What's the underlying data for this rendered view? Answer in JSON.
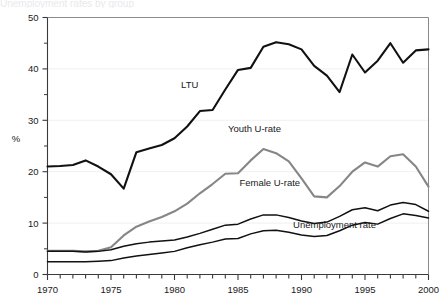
{
  "chart_data": {
    "type": "line",
    "title": "",
    "xlabel": "",
    "ylabel": "%",
    "xlim": [
      1970,
      2000
    ],
    "ylim": [
      0,
      50
    ],
    "grid": "horizontal-faint",
    "legend": "inline-annotations",
    "x_ticks_major": [
      1970,
      1975,
      1980,
      1985,
      1990,
      1995,
      2000
    ],
    "x_tick_labels": [
      "1970",
      "1975",
      "1980",
      "1985",
      "1990",
      "1995",
      "2000"
    ],
    "x_ticks_minor_step": 1,
    "y_ticks_major": [
      0,
      10,
      20,
      30,
      40,
      50
    ],
    "y_tick_labels": [
      "0",
      "10",
      "20",
      "30",
      "40",
      "50"
    ],
    "y_ticks_minor": [
      5,
      15,
      25,
      35,
      45
    ],
    "x": [
      1970,
      1971,
      1972,
      1973,
      1974,
      1975,
      1976,
      1977,
      1978,
      1979,
      1980,
      1981,
      1982,
      1983,
      1984,
      1985,
      1986,
      1987,
      1988,
      1989,
      1990,
      1991,
      1992,
      1993,
      1994,
      1995,
      1996,
      1997,
      1998,
      1999,
      2000
    ],
    "series": [
      {
        "name": "LTU",
        "label": "LTU",
        "color": "#111111",
        "width": 2.1,
        "values": [
          21.0,
          21.1,
          21.3,
          22.2,
          21.0,
          19.5,
          16.7,
          23.8,
          24.5,
          25.2,
          26.5,
          28.8,
          31.8,
          32.0,
          36.0,
          39.8,
          40.2,
          44.3,
          45.2,
          44.8,
          43.8,
          40.6,
          38.7,
          35.5,
          42.8,
          39.3,
          41.6,
          45.0,
          41.2,
          43.6,
          43.8
        ]
      },
      {
        "name": "Youth U-rate",
        "label": "Youth U-rate",
        "color": "#868686",
        "width": 2.1,
        "values": [
          4.6,
          4.6,
          4.6,
          4.5,
          4.6,
          5.3,
          7.6,
          9.3,
          10.3,
          11.2,
          12.3,
          13.8,
          15.8,
          17.6,
          19.6,
          19.7,
          22.2,
          24.4,
          23.6,
          22.0,
          18.7,
          15.2,
          15.0,
          17.2,
          20.0,
          21.8,
          21.0,
          23.0,
          23.4,
          21.0,
          17.1
        ]
      },
      {
        "name": "Female U-rate",
        "label": "Female U-rate",
        "color": "#111111",
        "width": 1.5,
        "values": [
          4.5,
          4.5,
          4.5,
          4.4,
          4.5,
          4.8,
          5.5,
          6.0,
          6.3,
          6.5,
          6.7,
          7.3,
          8.0,
          8.8,
          9.6,
          9.8,
          10.8,
          11.6,
          11.6,
          11.1,
          10.4,
          9.9,
          10.2,
          11.3,
          12.6,
          13.0,
          12.4,
          13.5,
          14.0,
          13.6,
          12.3
        ]
      },
      {
        "name": "Unemployment rate",
        "label": "Unemployment rate",
        "color": "#111111",
        "width": 1.5,
        "values": [
          2.5,
          2.5,
          2.5,
          2.5,
          2.6,
          2.7,
          3.2,
          3.6,
          3.9,
          4.2,
          4.5,
          5.2,
          5.8,
          6.3,
          6.9,
          7.0,
          7.9,
          8.5,
          8.6,
          8.2,
          7.7,
          7.4,
          7.6,
          8.5,
          9.6,
          10.1,
          9.8,
          10.9,
          11.8,
          11.5,
          11.0
        ]
      }
    ],
    "annotations": [
      {
        "text": "LTU",
        "x": 1981.2,
        "y": 36.2,
        "anchor": "middle"
      },
      {
        "text": "Youth U-rate",
        "x": 1986.3,
        "y": 27.7,
        "anchor": "middle"
      },
      {
        "text": "Female U-rate",
        "x": 1987.5,
        "y": 17.2,
        "anchor": "middle"
      },
      {
        "text": "Unemployment rate",
        "x": 1992.6,
        "y": 9.0,
        "anchor": "middle"
      }
    ]
  },
  "figure": {
    "cropped_title_sliver": "Unemployment rates by group"
  }
}
